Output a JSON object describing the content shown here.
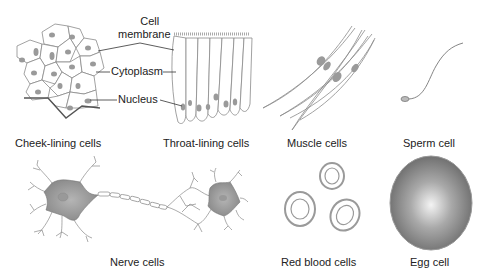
{
  "diagram": {
    "type": "cell-types-illustration",
    "annotations": {
      "cell_membrane": "Cell\nmembrane",
      "cell_membrane_line1": "Cell",
      "cell_membrane_line2": "membrane",
      "cytoplasm": "Cytoplasm",
      "nucleus": "Nucleus"
    },
    "cells": [
      {
        "id": "cheek",
        "caption": "Cheek-lining cells"
      },
      {
        "id": "throat",
        "caption": "Throat-lining cells"
      },
      {
        "id": "muscle",
        "caption": "Muscle cells"
      },
      {
        "id": "sperm",
        "caption": "Sperm cell"
      },
      {
        "id": "nerve",
        "caption": "Nerve cells"
      },
      {
        "id": "rbc",
        "caption": "Red blood cells"
      },
      {
        "id": "egg",
        "caption": "Egg cell"
      }
    ],
    "colors": {
      "outline": "#8a8a8a",
      "nucleus": "#9a9a9a",
      "egg_center": "#f2f2f2",
      "egg_edge": "#6e6e6e",
      "text": "#222222"
    }
  }
}
